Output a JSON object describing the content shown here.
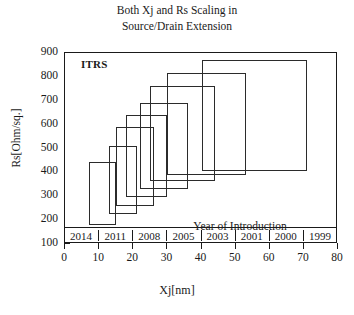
{
  "chart_data": {
    "type": "bar",
    "title": "Both Xj and Rs Scaling in Source/Drain Extension",
    "title_lines": [
      "Both Xj and Rs Scaling in",
      "Source/Drain Extension"
    ],
    "xlabel": "Xj[nm]",
    "ylabel": "Rs[Ohm/sq.]",
    "xlim": [
      0,
      80
    ],
    "ylim": [
      100,
      900
    ],
    "xticks": [
      0,
      10,
      20,
      30,
      40,
      50,
      60,
      70,
      80
    ],
    "yticks": [
      100,
      200,
      300,
      400,
      500,
      600,
      700,
      800,
      900
    ],
    "grid": false,
    "legend": "none",
    "annotations": [
      {
        "text": "ITRS",
        "x": 5,
        "y": 855
      },
      {
        "text": "Year of Introduction",
        "x": 52,
        "y": 215
      }
    ],
    "category_axis_label": "Year of Introduction",
    "categories": [
      "2014",
      "2011",
      "2008",
      "2005",
      "2003",
      "2001",
      "2000",
      "1999"
    ],
    "series": [
      {
        "name": "ITRS Xj / Rs requirement boxes",
        "boxes": [
          {
            "year": "2014",
            "xj_min": 7,
            "xj_max": 15,
            "rs_min": 180,
            "rs_max": 445
          },
          {
            "year": "2011",
            "xj_min": 13,
            "xj_max": 21,
            "rs_min": 225,
            "rs_max": 510
          },
          {
            "year": "2008",
            "xj_min": 15,
            "xj_max": 26,
            "rs_min": 260,
            "rs_max": 590
          },
          {
            "year": "2005",
            "xj_min": 18,
            "xj_max": 30,
            "rs_min": 295,
            "rs_max": 640
          },
          {
            "year": "2003",
            "xj_min": 22,
            "xj_max": 36,
            "rs_min": 330,
            "rs_max": 690
          },
          {
            "year": "2001",
            "xj_min": 25,
            "xj_max": 44,
            "rs_min": 365,
            "rs_max": 760
          },
          {
            "year": "2000",
            "xj_min": 30,
            "xj_max": 53,
            "rs_min": 390,
            "rs_max": 815
          },
          {
            "year": "1999",
            "xj_min": 40,
            "xj_max": 71,
            "rs_min": 405,
            "rs_max": 870
          }
        ]
      }
    ],
    "colors": {
      "line": "#2b2b2b",
      "frame": "#1a1a1a",
      "background": "#ffffff"
    }
  }
}
